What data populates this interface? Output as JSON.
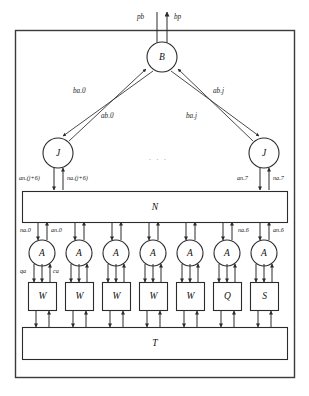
{
  "diagram": {
    "frame": {
      "name": "outer-boundary"
    },
    "io_ports": [
      {
        "id": "pb",
        "label": "pb",
        "direction": "in"
      },
      {
        "id": "bp",
        "label": "bp",
        "direction": "out"
      }
    ],
    "nodes": {
      "broker": {
        "id": "B",
        "label": "B",
        "shape": "circle"
      },
      "junctions": [
        {
          "id": "J-left",
          "label": "J",
          "shape": "circle"
        },
        {
          "id": "J-right",
          "label": "J",
          "shape": "circle"
        }
      ],
      "agents": [
        {
          "id": "A0",
          "label": "A",
          "shape": "circle"
        },
        {
          "id": "A1",
          "label": "A",
          "shape": "circle"
        },
        {
          "id": "A2",
          "label": "A",
          "shape": "circle"
        },
        {
          "id": "A3",
          "label": "A",
          "shape": "circle"
        },
        {
          "id": "A4",
          "label": "A",
          "shape": "circle"
        },
        {
          "id": "A5",
          "label": "A",
          "shape": "circle"
        },
        {
          "id": "A6",
          "label": "A",
          "shape": "circle"
        }
      ],
      "workers": [
        {
          "id": "W0",
          "label": "W",
          "shape": "rect"
        },
        {
          "id": "W1",
          "label": "W",
          "shape": "rect"
        },
        {
          "id": "W2",
          "label": "W",
          "shape": "rect"
        },
        {
          "id": "W3",
          "label": "W",
          "shape": "rect"
        },
        {
          "id": "W4",
          "label": "W",
          "shape": "rect"
        },
        {
          "id": "Q5",
          "label": "Q",
          "shape": "rect"
        },
        {
          "id": "S6",
          "label": "S",
          "shape": "rect"
        }
      ],
      "network": {
        "id": "N",
        "label": "N",
        "shape": "rect"
      },
      "transport": {
        "id": "T",
        "label": "T",
        "shape": "rect"
      }
    },
    "edge_labels": {
      "ba_0": "ba.0",
      "ab_0": "ab.0",
      "ab_j": "ab.j",
      "ba_j": "ba.j"
    },
    "port_labels": {
      "an_j6": "an.(j+6)",
      "na_j6": "na.(j+6)",
      "an_7": "an.7",
      "na_7": "na.7",
      "na_0": "na.0",
      "an_0": "an.0",
      "na_6": "na.6",
      "an_6": "an.6",
      "qa": "qa",
      "ca": "ca"
    },
    "ellipsis": ". . .",
    "colors": {
      "stroke": "#2b2b2b",
      "frame": "#3a3a3a",
      "text": "#111111",
      "ellipsis": "#9a9a9a",
      "background": "#ffffff"
    }
  }
}
